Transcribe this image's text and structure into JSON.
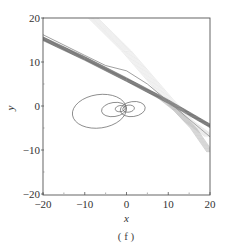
{
  "chart_data": {
    "type": "line",
    "title": "",
    "subtitle": "",
    "xlabel": "x",
    "ylabel": "y",
    "xlim": [
      -20,
      20
    ],
    "ylim": [
      -20,
      20
    ],
    "x_ticks": [
      -20,
      -10,
      0,
      10,
      20
    ],
    "y_ticks": [
      -20,
      -10,
      0,
      10,
      20
    ],
    "x_tick_labels": [
      "−20",
      "−10",
      "0",
      "10",
      "20"
    ],
    "y_tick_labels": [
      "−20",
      "−10",
      "0",
      "10",
      "20"
    ],
    "grid": false,
    "legend": null,
    "caption": "( f )",
    "series": [
      {
        "name": "dark band (dense trajectories)",
        "color": "#444444",
        "style": "thick band",
        "points": [
          [
            -20,
            15.3
          ],
          [
            -10,
            10.8
          ],
          [
            0,
            6.0
          ],
          [
            10,
            1.0
          ],
          [
            20,
            -4.5
          ]
        ]
      },
      {
        "name": "thin upper curve",
        "color": "#777777",
        "style": "thin",
        "points": [
          [
            -20,
            16.2
          ],
          [
            -10,
            11.5
          ],
          [
            -5,
            9.2
          ],
          [
            0,
            8.0
          ],
          [
            5,
            5.0
          ],
          [
            10,
            1.0
          ],
          [
            15,
            -3.0
          ],
          [
            20,
            -7.0
          ]
        ]
      },
      {
        "name": "light fan (faint trajectories)",
        "color": "#bbbbbb",
        "style": "faint band",
        "points": [
          [
            -8,
            20.0
          ],
          [
            0,
            12.5
          ],
          [
            5,
            7.0
          ],
          [
            10,
            1.5
          ],
          [
            15,
            -3.5
          ],
          [
            20,
            -7.0
          ]
        ]
      },
      {
        "name": "lower right band",
        "color": "#888888",
        "style": "hatched band",
        "points": [
          [
            8,
            2.0
          ],
          [
            12,
            -1.0
          ],
          [
            16,
            -5.0
          ],
          [
            20,
            -10.5
          ]
        ]
      },
      {
        "name": "butterfly loops",
        "color": "#666666",
        "style": "closed loops",
        "loops": [
          {
            "cx": -6.5,
            "cy": -1.2,
            "rx": 6.5,
            "ry": 3.8
          },
          {
            "cx": -3.0,
            "cy": -0.8,
            "rx": 3.0,
            "ry": 1.6
          },
          {
            "cx": -1.5,
            "cy": -0.6,
            "rx": 1.2,
            "ry": 0.7
          },
          {
            "cx": 1.5,
            "cy": -0.7,
            "rx": 3.0,
            "ry": 1.7
          },
          {
            "cx": 0.5,
            "cy": -0.6,
            "rx": 1.4,
            "ry": 0.8
          }
        ]
      }
    ]
  }
}
